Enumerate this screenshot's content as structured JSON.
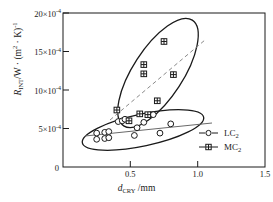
{
  "chart_data": {
    "type": "scatter",
    "title": "",
    "xlabel": "d_CRY /mm",
    "ylabel": "R_INT/W·(m²·K)⁻¹",
    "xlim": [
      0,
      1.5
    ],
    "ylim": [
      0,
      0.002
    ],
    "y_scale_factor": "×10⁻⁴",
    "grid": false,
    "legend_position": "bottom-right",
    "xticks": [
      "0",
      "0.5",
      "1.0",
      "1.5"
    ],
    "xtick_values": [
      0,
      0.5,
      1.0,
      1.5
    ],
    "yticks": [
      "0",
      "5×10",
      "10×10",
      "15×10",
      "20×10"
    ],
    "ytick_values": [
      0,
      5,
      10,
      15,
      20
    ],
    "ytick_exponent": "-4",
    "series": [
      {
        "name": "LC₂",
        "marker": "open-circle",
        "trend": "solid",
        "ellipse": "solid",
        "points": [
          {
            "x": 0.25,
            "y": 4.4
          },
          {
            "x": 0.25,
            "y": 3.6
          },
          {
            "x": 0.31,
            "y": 4.5
          },
          {
            "x": 0.31,
            "y": 3.7
          },
          {
            "x": 0.34,
            "y": 4.6
          },
          {
            "x": 0.34,
            "y": 3.8
          },
          {
            "x": 0.41,
            "y": 5.9
          },
          {
            "x": 0.44,
            "y": 6.0
          },
          {
            "x": 0.46,
            "y": 6.2
          },
          {
            "x": 0.53,
            "y": 4.1
          },
          {
            "x": 0.55,
            "y": 5.1
          },
          {
            "x": 0.6,
            "y": 5.8
          },
          {
            "x": 0.67,
            "y": 6.8
          },
          {
            "x": 0.72,
            "y": 4.4
          },
          {
            "x": 0.8,
            "y": 5.6
          }
        ]
      },
      {
        "name": "MC₂",
        "marker": "crossed-square",
        "trend": "dashed",
        "ellipse": "solid",
        "points": [
          {
            "x": 0.4,
            "y": 7.4
          },
          {
            "x": 0.49,
            "y": 6.0
          },
          {
            "x": 0.57,
            "y": 6.9
          },
          {
            "x": 0.6,
            "y": 13.3
          },
          {
            "x": 0.6,
            "y": 12.1
          },
          {
            "x": 0.63,
            "y": 6.8
          },
          {
            "x": 0.7,
            "y": 8.6
          },
          {
            "x": 0.75,
            "y": 16.3
          },
          {
            "x": 0.82,
            "y": 12.0
          }
        ]
      }
    ]
  },
  "legend": {
    "items": [
      {
        "label": "LC",
        "sub": "2",
        "marker": "open-circle"
      },
      {
        "label": "MC",
        "sub": "2",
        "marker": "crossed-square"
      }
    ]
  },
  "axis_text": {
    "x_symbol": "d",
    "x_sub": "CRY",
    "x_unit": "/mm",
    "y_symbol": "R",
    "y_sub": "INT",
    "y_unit": "/W · (m",
    "y_unit2": "· K)",
    "y_sup_m": "2",
    "y_sup_end": "-1"
  },
  "colors": {
    "axis": "#1a1a1a",
    "marker": "#1a1a1a",
    "trend_lc": "#555555",
    "trend_mc": "#888888",
    "background": "#ffffff"
  }
}
